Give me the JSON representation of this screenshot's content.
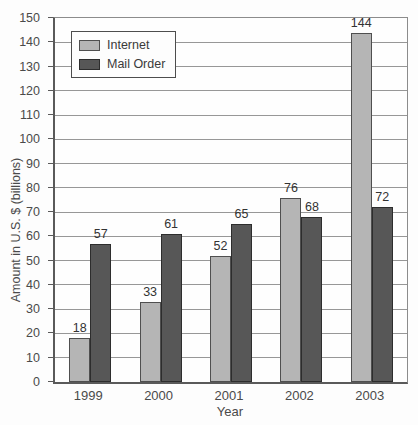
{
  "chart_data": {
    "type": "bar",
    "title": "",
    "categories": [
      "1999",
      "2000",
      "2001",
      "2002",
      "2003"
    ],
    "series": [
      {
        "name": "Internet",
        "color": "#b5b5b5",
        "border_color": "#4f4f4f",
        "values": [
          18,
          33,
          52,
          76,
          144
        ]
      },
      {
        "name": "Mail Order",
        "color": "#575757",
        "border_color": "#2d2d2d",
        "values": [
          57,
          61,
          65,
          68,
          72
        ]
      }
    ],
    "xlabel": "Year",
    "ylabel": "Amount in U.S. $ (billions)",
    "ylim": [
      0,
      150
    ],
    "yticks": [
      0,
      10,
      20,
      30,
      40,
      50,
      60,
      70,
      80,
      90,
      100,
      110,
      120,
      130,
      140,
      150
    ],
    "grid": "horizontal",
    "legend_position": "top-left",
    "bar_value_labels": true
  }
}
